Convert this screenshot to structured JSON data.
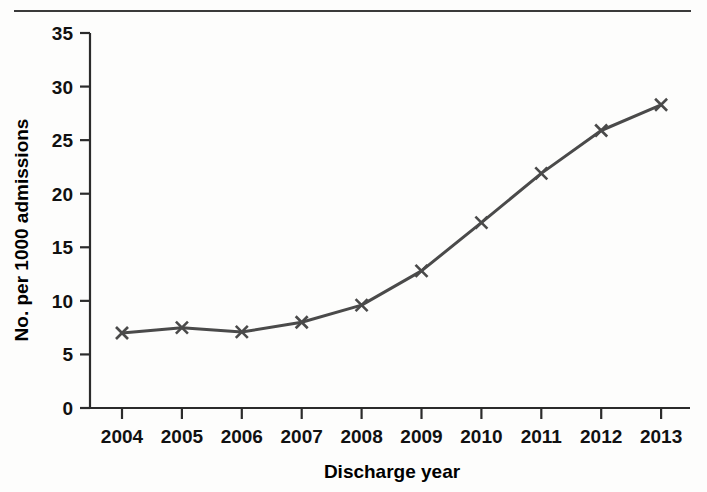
{
  "chart_data": {
    "type": "line",
    "title": "",
    "xlabel": "Discharge year",
    "ylabel": "No. per 1000 admissions",
    "categories": [
      "2004",
      "2005",
      "2006",
      "2007",
      "2008",
      "2009",
      "2010",
      "2011",
      "2012",
      "2013"
    ],
    "values": [
      7.0,
      7.5,
      7.1,
      8.0,
      9.6,
      12.8,
      17.3,
      21.9,
      25.9,
      28.3
    ],
    "series": [
      {
        "name": "No. per 1000 admissions",
        "values": [
          7.0,
          7.5,
          7.1,
          8.0,
          9.6,
          12.8,
          17.3,
          21.9,
          25.9,
          28.3
        ]
      }
    ],
    "ylim": [
      0,
      35
    ],
    "yticks": [
      "0",
      "5",
      "10",
      "15",
      "20",
      "25",
      "30",
      "35"
    ],
    "ytick_values": [
      0,
      5,
      10,
      15,
      20,
      25,
      30,
      35
    ],
    "xticks": [
      "2004",
      "2005",
      "2006",
      "2007",
      "2008",
      "2009",
      "2010",
      "2011",
      "2012",
      "2013"
    ],
    "grid": false,
    "legend": "none",
    "marker": "x",
    "line_color": "#4a4a4a",
    "marker_color": "#4a4a4a",
    "axis_color": "#2b2b2b",
    "background_color": "#fdfdfc"
  },
  "figure": {
    "top_rule": "horizontal-rule"
  }
}
